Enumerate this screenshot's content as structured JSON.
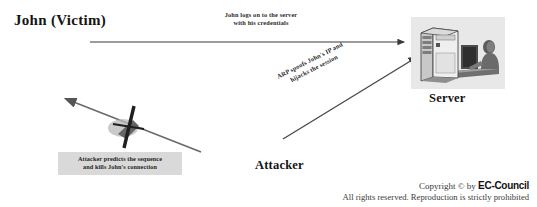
{
  "diagram": {
    "actors": {
      "victim": "John (Victim)",
      "server": "Server",
      "attacker": "Attacker"
    },
    "flows": [
      {
        "id": "login-flow",
        "text": "John logs on to the server with his credentials",
        "line1": "John logs on to the server",
        "line2": "with his credentials",
        "direction": "victim-to-server"
      },
      {
        "id": "spoof-flow",
        "text": "ARP spoofs John's IP and hijacks the session",
        "line1": "ARP spoofs John's IP and",
        "line2": "hijacks the session",
        "direction": "attacker-to-server"
      },
      {
        "id": "kill-flow",
        "text": "Attacker predicts the sequence and kills John's connection",
        "line1": "Attacker predicts the sequence",
        "line2": "and kills John's connection",
        "direction": "attacker-to-victim-broken"
      }
    ],
    "icons": {
      "server": "server-tower-icon",
      "operator": "person-at-desk-icon",
      "break": "connection-broken-icon"
    },
    "colors": {
      "line": "#3a3a3a",
      "note_background": "#d9d9d9",
      "text": "#1a1a1a",
      "image_background": "#e8e8e8"
    }
  },
  "footer": {
    "copyright_prefix": "Copyright © by ",
    "brand": "EC-Council",
    "rights": "All rights reserved. Reproduction is strictly prohibited"
  }
}
